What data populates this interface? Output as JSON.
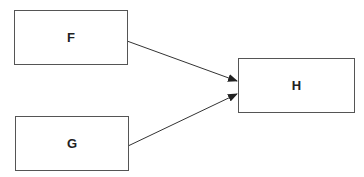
{
  "diagram": {
    "nodes": [
      {
        "id": "F",
        "label": "F"
      },
      {
        "id": "G",
        "label": "G"
      },
      {
        "id": "H",
        "label": "H"
      }
    ],
    "edges": [
      {
        "from": "F",
        "to": "H"
      },
      {
        "from": "G",
        "to": "H"
      }
    ]
  }
}
